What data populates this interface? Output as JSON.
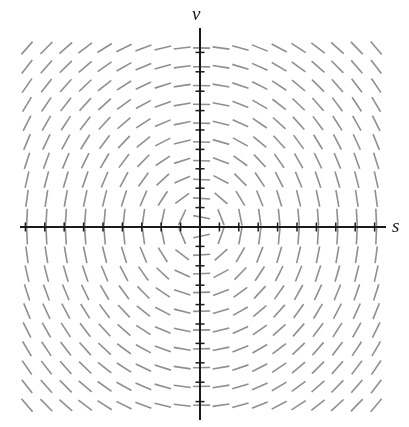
{
  "figure": {
    "width": 409,
    "height": 427,
    "background": "#ffffff"
  },
  "axes": {
    "horizontal": {
      "label": "s",
      "label_style": "italic-serif",
      "color": "#1a1a1a",
      "y_pixel": 227,
      "x_start_pixel": 20,
      "x_end_pixel": 386,
      "line_width": 2.0,
      "tick_count": 19,
      "tick_length": 9,
      "tick_spacing_pixel": 19.4
    },
    "vertical": {
      "label": "v",
      "label_style": "italic-serif",
      "color": "#1a1a1a",
      "x_pixel": 200,
      "y_start_pixel": 28,
      "y_end_pixel": 420,
      "line_width": 2.0,
      "tick_count": 19,
      "tick_length": 9,
      "tick_spacing_pixel": 19.4
    }
  },
  "chart_data": {
    "type": "scatter",
    "plot_kind": "direction-field",
    "title": "",
    "xlabel": "s",
    "ylabel": "v",
    "xlim": [
      -9.5,
      9.5
    ],
    "ylim": [
      -9.5,
      10.5
    ],
    "grid": false,
    "legend": null,
    "dash": {
      "color": "#8f8f8f",
      "length_pixels": 17,
      "width_pixels": 1.6,
      "cap": "butt"
    },
    "grid_layout": {
      "columns": 19,
      "rows": 20,
      "x_first_pixel": 27,
      "x_step_pixel": 19.4,
      "y_first_pixel": 48,
      "y_step_pixel": 18.8
    },
    "slope_model": {
      "formula": "dv/ds = -s / (v + eps)",
      "field_vector": "(ds, dv) = (v, -s) scaled elliptically",
      "rotation": "clockwise",
      "aspect_x": 1.0,
      "aspect_y": 0.92,
      "singular_point": [
        0,
        0
      ]
    },
    "quadrant_slope_signs": {
      "upper_left": "positive (dashes rise to the right)",
      "upper_right": "negative (dashes fall to the right)",
      "lower_left": "negative (dashes fall to the right)",
      "lower_right": "positive (dashes rise to the right)"
    },
    "sampled_angles_degrees": [
      {
        "s": -9,
        "v": 9,
        "angle": 46
      },
      {
        "s": -5,
        "v": 9,
        "angle": 30
      },
      {
        "s": 0,
        "v": 9,
        "angle": 0
      },
      {
        "s": 5,
        "v": 9,
        "angle": -30
      },
      {
        "s": 9,
        "v": 9,
        "angle": -46
      },
      {
        "s": -9,
        "v": 5,
        "angle": 62
      },
      {
        "s": 0,
        "v": 5,
        "angle": 0
      },
      {
        "s": 9,
        "v": 5,
        "angle": -62
      },
      {
        "s": -9,
        "v": 1,
        "angle": 84
      },
      {
        "s": -1,
        "v": 1,
        "angle": 46
      },
      {
        "s": 1,
        "v": 1,
        "angle": -46
      },
      {
        "s": 9,
        "v": 1,
        "angle": -84
      },
      {
        "s": -9,
        "v": -1,
        "angle": -84
      },
      {
        "s": -1,
        "v": -1,
        "angle": -46
      },
      {
        "s": 1,
        "v": -1,
        "angle": 46
      },
      {
        "s": 9,
        "v": -1,
        "angle": 84
      },
      {
        "s": -9,
        "v": -5,
        "angle": -62
      },
      {
        "s": 0,
        "v": -5,
        "angle": 0
      },
      {
        "s": 9,
        "v": -5,
        "angle": 62
      },
      {
        "s": -9,
        "v": -9,
        "angle": -46
      },
      {
        "s": 0,
        "v": -9,
        "angle": 0
      },
      {
        "s": 9,
        "v": -9,
        "angle": 46
      }
    ]
  }
}
